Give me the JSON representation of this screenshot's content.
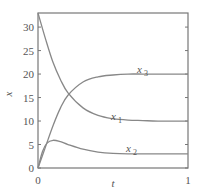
{
  "chart_data": {
    "type": "line",
    "title": "",
    "xlabel": "t",
    "ylabel": "x",
    "xlim": [
      0,
      1
    ],
    "ylim": [
      0,
      33
    ],
    "x_ticks": [
      "0",
      "1"
    ],
    "y_ticks": [
      "0",
      "5",
      "10",
      "15",
      "20",
      "25",
      "30"
    ],
    "grid": false,
    "legend": "inline labels",
    "series": [
      {
        "name": "x1",
        "label_main": "x",
        "label_sub": "1",
        "x": [
          0,
          0.05,
          0.1,
          0.15,
          0.2,
          0.3,
          0.4,
          0.5,
          0.6,
          0.7,
          0.8,
          1.0
        ],
        "values": [
          33,
          27.5,
          22.5,
          18.8,
          16.0,
          12.8,
          11.2,
          10.5,
          10.2,
          10.1,
          10.0,
          10.0
        ]
      },
      {
        "name": "x2",
        "label_main": "x",
        "label_sub": "2",
        "x": [
          0,
          0.03,
          0.06,
          0.1,
          0.15,
          0.2,
          0.3,
          0.4,
          0.5,
          0.6,
          0.8,
          1.0
        ],
        "values": [
          0,
          3.5,
          5.3,
          5.9,
          5.6,
          5.0,
          4.0,
          3.4,
          3.1,
          3.0,
          3.0,
          3.0
        ]
      },
      {
        "name": "x3",
        "label_main": "x",
        "label_sub": "3",
        "x": [
          0,
          0.05,
          0.1,
          0.15,
          0.2,
          0.3,
          0.4,
          0.5,
          0.6,
          0.7,
          0.8,
          1.0
        ],
        "values": [
          0,
          4.5,
          9.0,
          12.8,
          15.5,
          18.3,
          19.4,
          19.8,
          20.0,
          20.0,
          20.0,
          20.0
        ]
      }
    ],
    "line_color": "#888888",
    "axis_color": "#777777"
  }
}
